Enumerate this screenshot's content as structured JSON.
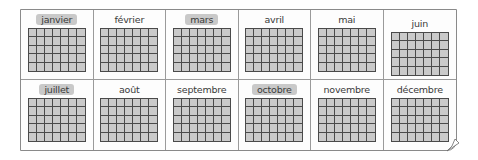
{
  "calendar": {
    "months": [
      {
        "label": "janvier",
        "highlight": true
      },
      {
        "label": "février",
        "highlight": false
      },
      {
        "label": "mars",
        "highlight": true
      },
      {
        "label": "avril",
        "highlight": false
      },
      {
        "label": "mai",
        "highlight": false
      },
      {
        "label": "juin",
        "highlight": false
      },
      {
        "label": "juillet",
        "highlight": true
      },
      {
        "label": "août",
        "highlight": false
      },
      {
        "label": "septembre",
        "highlight": false
      },
      {
        "label": "octobre",
        "highlight": true
      },
      {
        "label": "novembre",
        "highlight": false
      },
      {
        "label": "décembre",
        "highlight": false
      }
    ],
    "grid_columns": 7,
    "grid_rows": 5
  }
}
